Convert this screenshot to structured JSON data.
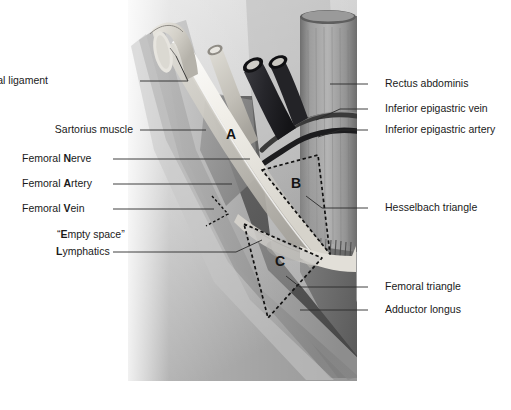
{
  "figure": {
    "background_color": "#ffffff",
    "panel_color_top": "#d8d8d8",
    "panel_color_bottom": "#9a9a9a"
  },
  "labels_left": [
    {
      "id": "inguinal-ligament",
      "text": "Inguinal ligament",
      "bold_initial": "",
      "plain": "Inguinal ligament",
      "x": 48,
      "y": 81,
      "leader": true
    },
    {
      "id": "sartorius-muscle",
      "text": "Sartorius muscle",
      "bold_initial": "",
      "plain": "Sartorius muscle",
      "x": 44,
      "y": 130,
      "leader": true
    },
    {
      "id": "femoral-nerve",
      "text": "Femoral Nerve",
      "bold_initial": "N",
      "plain": "Femoral ",
      "rest": "erve",
      "x": 22,
      "y": 159,
      "leader": true
    },
    {
      "id": "femoral-artery",
      "text": "Femoral Artery",
      "bold_initial": "A",
      "plain": "Femoral ",
      "rest": "rtery",
      "x": 22,
      "y": 184,
      "leader": true
    },
    {
      "id": "femoral-vein",
      "text": "Femoral Vein",
      "bold_initial": "V",
      "plain": "Femoral ",
      "rest": "ein",
      "x": 22,
      "y": 209,
      "leader": true
    },
    {
      "id": "empty-space",
      "text": "“Empty space”",
      "bold_initial": "E",
      "plain": "“",
      "rest": "mpty space”",
      "x": 57,
      "y": 235,
      "leader": false
    },
    {
      "id": "lymphatics",
      "text": "Lymphatics",
      "bold_initial": "L",
      "plain": "",
      "rest": "ymphatics",
      "x": 56,
      "y": 252,
      "leader": true
    }
  ],
  "labels_right": [
    {
      "id": "rectus-abdominis",
      "text": "Rectus abdominis",
      "x": 385,
      "y": 84,
      "leader": true
    },
    {
      "id": "inferior-epigastric-vein",
      "text": "Inferior epigastric vein",
      "x": 385,
      "y": 109,
      "leader": true
    },
    {
      "id": "inferior-epigastric-artery",
      "text": "Inferior epigastric artery",
      "x": 385,
      "y": 130,
      "leader": true
    },
    {
      "id": "hesselbach-triangle",
      "text": "Hesselbach triangle",
      "x": 385,
      "y": 208,
      "leader": true
    },
    {
      "id": "femoral-triangle",
      "text": "Femoral triangle",
      "x": 385,
      "y": 287,
      "leader": true
    },
    {
      "id": "adductor-longus",
      "text": "Adductor longus",
      "x": 385,
      "y": 310,
      "leader": true
    }
  ],
  "region_letters": [
    {
      "id": "region-a",
      "text": "A",
      "x": 231,
      "y": 135
    },
    {
      "id": "region-b",
      "text": "B",
      "x": 296,
      "y": 184
    },
    {
      "id": "region-c",
      "text": "C",
      "x": 280,
      "y": 262
    }
  ],
  "mnemonic": {
    "name": "NAVEL",
    "note": "Bold initials on the left labels spell the lateral-to-medial order of femoral structures"
  },
  "colors": {
    "ink": "#1a1a1a",
    "dashed_outline": "#111111",
    "vein_dark": "#2b2b2e",
    "artery_pale": "#f2f0ea",
    "muscle_mid": "#8e8e8e",
    "muscle_dark": "#5c5c5c",
    "muscle_light": "#bdbdbd",
    "ligament_pale": "#e3e1db"
  }
}
